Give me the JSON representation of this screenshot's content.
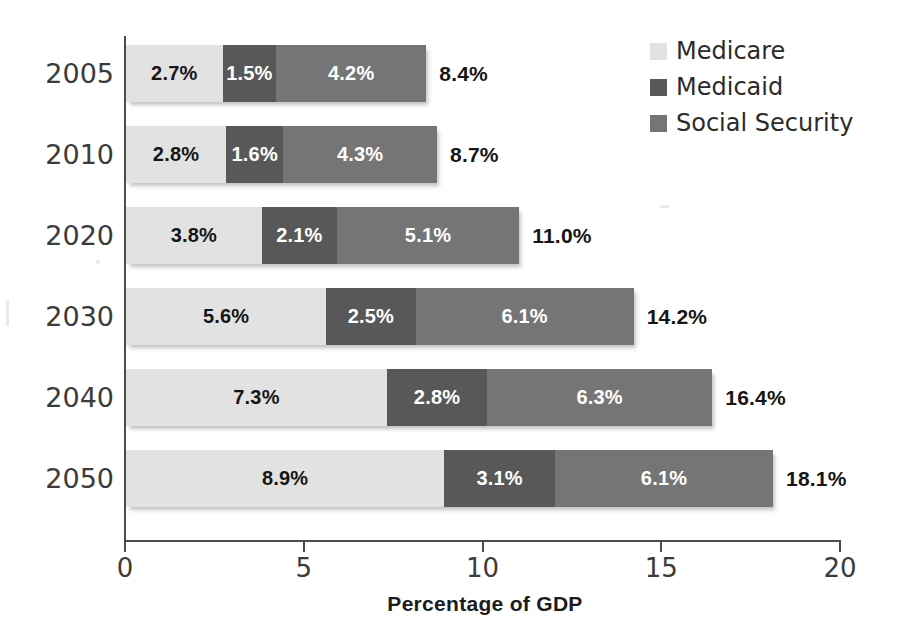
{
  "chart_data": {
    "type": "bar",
    "orientation": "horizontal",
    "stacked": true,
    "title": "",
    "xlabel": "Percentage of GDP",
    "ylabel": "",
    "xlim": [
      0,
      20
    ],
    "xticks": [
      "0",
      "5",
      "10",
      "15",
      "20"
    ],
    "xtick_values": [
      0,
      5,
      10,
      15,
      20
    ],
    "grid": false,
    "legend_position": "top-right",
    "categories": [
      "2005",
      "2010",
      "2020",
      "2030",
      "2040",
      "2050"
    ],
    "series": [
      {
        "name": "Medicare",
        "color": "#e2e2e2",
        "values": [
          2.7,
          2.8,
          3.8,
          5.6,
          7.3,
          8.9
        ],
        "labels": [
          "2.7%",
          "2.8%",
          "3.8%",
          "5.6%",
          "7.3%",
          "8.9%"
        ]
      },
      {
        "name": "Medicaid",
        "color": "#585858",
        "values": [
          1.5,
          1.6,
          2.1,
          2.5,
          2.8,
          3.1
        ],
        "labels": [
          "1.5%",
          "1.6%",
          "2.1%",
          "2.5%",
          "2.8%",
          "3.1%"
        ]
      },
      {
        "name": "Social Security",
        "color": "#757575",
        "values": [
          4.2,
          4.3,
          5.1,
          6.1,
          6.3,
          6.1
        ],
        "labels": [
          "4.2%",
          "4.3%",
          "5.1%",
          "6.1%",
          "6.3%",
          "6.1%"
        ]
      }
    ],
    "totals": [
      8.4,
      8.7,
      11.0,
      14.2,
      16.4,
      18.1
    ],
    "total_labels": [
      "8.4%",
      "8.7%",
      "11.0%",
      "14.2%",
      "16.4%",
      "18.1%"
    ]
  },
  "legend": {
    "items": [
      {
        "label": "Medicare",
        "color": "#e2e2e2",
        "swatch": "legend-swatch-medicare"
      },
      {
        "label": "Medicaid",
        "color": "#585858",
        "swatch": "legend-swatch-medicaid"
      },
      {
        "label": "Social Security",
        "color": "#757575",
        "swatch": "legend-swatch-social-security"
      }
    ]
  },
  "axis": {
    "x_title": "Percentage of GDP",
    "ticks": [
      "0",
      "5",
      "10",
      "15",
      "20"
    ],
    "category_labels": [
      "2005",
      "2010",
      "2020",
      "2030",
      "2040",
      "2050"
    ]
  },
  "colors": {
    "medicare": "#e2e2e2",
    "medicaid": "#585858",
    "social_security": "#757575",
    "axis": "#4c4c4c",
    "text": "#1c1c1c",
    "background": "#ffffff"
  }
}
